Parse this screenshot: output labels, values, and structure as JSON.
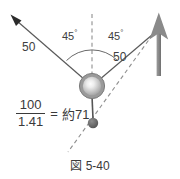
{
  "figure": {
    "caption": "図 5-40",
    "angle_left": "45",
    "angle_right": "45",
    "degree_symbol": "°",
    "magnitude_left": "50",
    "magnitude_right": "50",
    "formula": {
      "numerator": "100",
      "denominator": "1.41",
      "equals": "=",
      "result": "約71"
    },
    "colors": {
      "line": "#555555",
      "arrow_dark": "#2b2b2b",
      "arrow_gray": "#808080",
      "ball_ring": "#8c8c8c",
      "ball_core": "#f0f0f0",
      "small_ball": "#6e6e6e",
      "dashed": "#8a8a8a",
      "text": "#3a3a3a",
      "background": "#ffffff"
    }
  }
}
